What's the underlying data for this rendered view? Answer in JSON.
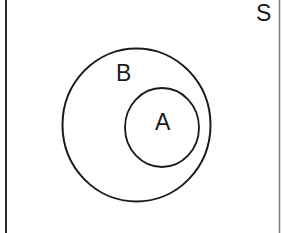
{
  "diagram": {
    "type": "venn",
    "universal_set": {
      "label": "S",
      "frame": {
        "left_x": 6,
        "right_x": 279,
        "left_color": "#2a2a2a",
        "right_color": "#777777"
      }
    },
    "sets": [
      {
        "label": "B",
        "cx": 136.5,
        "cy": 125,
        "rx": 74,
        "ry": 76.5,
        "stroke": "#1a1a1a",
        "contains": [
          "A"
        ]
      },
      {
        "label": "A",
        "cx": 162,
        "cy": 127.5,
        "rx": 37,
        "ry": 39.5,
        "stroke": "#1a1a1a",
        "subset_of": "B"
      }
    ],
    "relationship": "A ⊂ B ⊂ S"
  }
}
